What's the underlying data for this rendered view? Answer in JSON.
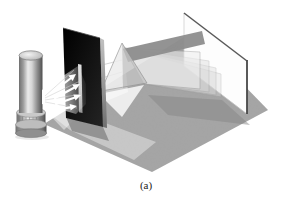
{
  "figure": {
    "caption_label": "(a)"
  },
  "colors": {
    "background": "#ffffff",
    "ground": "#a4a4a4",
    "ground_shadow": "#8a8a8a",
    "slit_screen": "#0d0d0d",
    "slit_opening_top": "#e0e0e0",
    "beam_sheet": "#d9d9d9",
    "beam_sheet_edge": "#979797",
    "beam_top_face": "#8d8d8d",
    "prism_left_face": "#ececec",
    "prism_right_face": "#c2c2c2",
    "prism_edge": "#8a8a8a",
    "viewing_screen": "#fdfdfd",
    "viewing_screen_top_edge": "#5a5a5a",
    "viewing_screen_right_edge": "#474747",
    "arrow": "#ffffff",
    "caption": "#222222"
  },
  "components": {
    "ground": "gray table surface",
    "light_source": "cylindrical lamp",
    "light_fan": "white light glow",
    "rays": "light ray arrows",
    "slit_screen": "black screen with vertical slit",
    "incoming_beam": "beam from slit to prism",
    "prism": "triangular glass prism",
    "beam_fan": "dispersed light sheets",
    "viewing_screen": "white viewing screen"
  }
}
